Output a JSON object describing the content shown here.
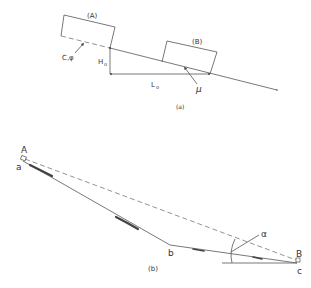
{
  "figure_a": {
    "caption": "(a)",
    "block_a_label": "(A)",
    "block_b_label": "(B)",
    "cohesion_friction_label": "C,φ",
    "height_label": "H",
    "height_sub": "o",
    "length_label": "L",
    "length_sub": "o",
    "friction_label": "μ"
  },
  "figure_b": {
    "caption": "(b)",
    "point_A": "A",
    "point_a": "a",
    "point_b": "b",
    "point_B": "B",
    "point_c": "c",
    "angle_label": "α"
  },
  "colors": {
    "line": "#555555",
    "dashed": "#777777",
    "shading": "#444444"
  }
}
